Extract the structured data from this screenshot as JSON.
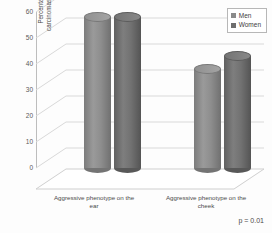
{
  "chart_data": {
    "type": "bar",
    "title": "",
    "subtitle": "",
    "xlabel": "",
    "ylabel": "Percentage of basal cell carcinomas per anatomic site",
    "categories": [
      "Aggressive phenotype on the ear",
      "Aggressive phenotype on the cheek"
    ],
    "series": [
      {
        "name": "Men",
        "values": [
          58,
          38
        ],
        "color": "#8a8a8a"
      },
      {
        "name": "Women",
        "values": [
          58,
          43
        ],
        "color": "#6e6e6e"
      }
    ],
    "ylim": [
      0,
      60
    ],
    "yticks": [
      0,
      10,
      20,
      30,
      40,
      50,
      60
    ],
    "ytick_labels": [
      "0",
      "10",
      "20",
      "30",
      "40",
      "50",
      "60"
    ],
    "grid": true,
    "legend_position": "top-right",
    "annotations": [
      {
        "name": "p-value",
        "text": "p = 0.01"
      }
    ],
    "style": "3d-cylinder",
    "axis_color": "#bdbdbd",
    "grid_color": "#d9d9d9",
    "background": "#ffffff"
  },
  "legend": {
    "items": [
      {
        "label": "Men",
        "swatch": "#8a8a8a"
      },
      {
        "label": "Women",
        "swatch": "#6e6e6e"
      }
    ]
  },
  "yaxis": {
    "title_line1": "Percentage of basal cell",
    "title_line2": "carcinomas per anatomic site",
    "ticks": [
      "60",
      "50",
      "40",
      "30",
      "20",
      "10",
      "0"
    ]
  },
  "xaxis": {
    "categories": [
      {
        "line1": "Aggressive phenotype on the",
        "line2": "ear"
      },
      {
        "line1": "Aggressive phenotype on the",
        "line2": "cheek"
      }
    ]
  },
  "footnote": {
    "text": "p = 0.01"
  }
}
